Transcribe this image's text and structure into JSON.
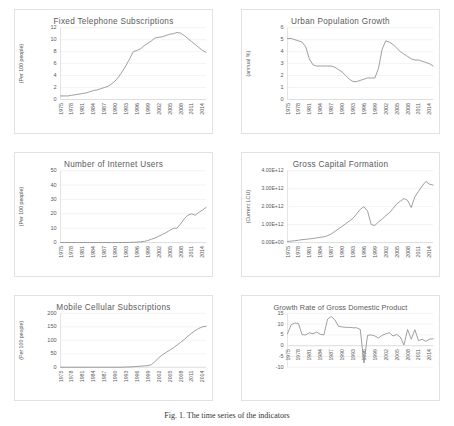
{
  "figure": {
    "caption": "Fig. 1. The time series of the indicators"
  },
  "chart_data": [
    {
      "type": "line",
      "title": "Fixed Telephone Subscriptions",
      "ylabel": "(Per 100 people)",
      "xlabel": "",
      "ylim": [
        0,
        12
      ],
      "yticks": [
        0,
        2,
        4,
        6,
        8,
        10,
        12
      ],
      "ytick_labels": [
        "0",
        "2",
        "4",
        "6",
        "8",
        "10",
        "12"
      ],
      "grid": true,
      "legend": "none",
      "xlim": [
        1975,
        2015
      ],
      "xtick_labels": [
        "1975",
        "1978",
        "1981",
        "1984",
        "1987",
        "1990",
        "1993",
        "1996",
        "1999",
        "2002",
        "2005",
        "2008",
        "2011",
        "2014"
      ],
      "x": [
        1975,
        1976,
        1977,
        1978,
        1979,
        1980,
        1981,
        1982,
        1983,
        1984,
        1985,
        1986,
        1987,
        1988,
        1989,
        1990,
        1991,
        1992,
        1993,
        1994,
        1995,
        1996,
        1997,
        1998,
        1999,
        2000,
        2001,
        2002,
        2003,
        2004,
        2005,
        2006,
        2007,
        2008,
        2009,
        2010,
        2011,
        2012,
        2013,
        2014,
        2015
      ],
      "values": [
        0.6,
        0.6,
        0.6,
        0.7,
        0.8,
        0.9,
        1.0,
        1.1,
        1.3,
        1.5,
        1.6,
        1.8,
        2.0,
        2.2,
        2.6,
        3.1,
        3.8,
        4.7,
        5.7,
        6.8,
        8.0,
        8.2,
        8.5,
        9.0,
        9.4,
        9.8,
        10.3,
        10.4,
        10.5,
        10.7,
        10.9,
        11.0,
        11.2,
        11.1,
        10.7,
        10.2,
        9.7,
        9.2,
        8.7,
        8.2,
        7.9
      ]
    },
    {
      "type": "line",
      "title": "Urban Population Growth",
      "ylabel": "(annual %)",
      "xlabel": "",
      "ylim": [
        0,
        6
      ],
      "yticks": [
        0,
        1,
        2,
        3,
        4,
        5,
        6
      ],
      "ytick_labels": [
        "0",
        "1",
        "2",
        "3",
        "4",
        "5",
        "6"
      ],
      "grid": true,
      "legend": "none",
      "xlim": [
        1975,
        2015
      ],
      "xtick_labels": [
        "1975",
        "1978",
        "1981",
        "1984",
        "1987",
        "1990",
        "1993",
        "1996",
        "1999",
        "2002",
        "2005",
        "2008",
        "2011",
        "2014"
      ],
      "x": [
        1975,
        1976,
        1977,
        1978,
        1979,
        1980,
        1981,
        1982,
        1983,
        1984,
        1985,
        1986,
        1987,
        1988,
        1989,
        1990,
        1991,
        1992,
        1993,
        1994,
        1995,
        1996,
        1997,
        1998,
        1999,
        2000,
        2001,
        2002,
        2003,
        2004,
        2005,
        2006,
        2007,
        2008,
        2009,
        2010,
        2011,
        2012,
        2013,
        2014,
        2015
      ],
      "values": [
        5.1,
        5.1,
        5.0,
        4.9,
        4.8,
        4.4,
        3.4,
        2.9,
        2.8,
        2.8,
        2.8,
        2.8,
        2.8,
        2.7,
        2.5,
        2.3,
        2.0,
        1.7,
        1.5,
        1.5,
        1.6,
        1.7,
        1.8,
        1.8,
        1.8,
        2.6,
        4.2,
        4.9,
        4.8,
        4.6,
        4.3,
        4.0,
        3.8,
        3.6,
        3.4,
        3.3,
        3.3,
        3.2,
        3.1,
        3.0,
        2.8
      ]
    },
    {
      "type": "line",
      "title": "Number of Internet Users",
      "ylabel": "(Per 100 people)",
      "xlabel": "",
      "ylim": [
        0,
        50
      ],
      "yticks": [
        0,
        10,
        20,
        30,
        40,
        50
      ],
      "ytick_labels": [
        "0",
        "10",
        "20",
        "30",
        "40",
        "50"
      ],
      "grid": true,
      "legend": "none",
      "xlim": [
        1975,
        2015
      ],
      "xtick_labels": [
        "1975",
        "1978",
        "1981",
        "1984",
        "1987",
        "1990",
        "1993",
        "1996",
        "1999",
        "2002",
        "2005",
        "2008",
        "2011",
        "2014"
      ],
      "x": [
        1975,
        1976,
        1977,
        1978,
        1979,
        1980,
        1981,
        1982,
        1983,
        1984,
        1985,
        1986,
        1987,
        1988,
        1989,
        1990,
        1991,
        1992,
        1993,
        1994,
        1995,
        1996,
        1997,
        1998,
        1999,
        2000,
        2001,
        2002,
        2003,
        2004,
        2005,
        2006,
        2007,
        2008,
        2009,
        2010,
        2011,
        2012,
        2013,
        2014,
        2015
      ],
      "values": [
        0,
        0,
        0,
        0,
        0,
        0,
        0,
        0,
        0,
        0,
        0,
        0,
        0,
        0,
        0,
        0,
        0,
        0,
        0.1,
        0.1,
        0.2,
        0.3,
        0.5,
        0.8,
        1.4,
        2.3,
        3.2,
        4.4,
        5.6,
        6.9,
        8.5,
        9.9,
        10.0,
        13.0,
        16.5,
        19.0,
        20.0,
        19.0,
        21.0,
        22.5,
        24.5,
        27.0,
        31.0,
        34.0,
        36.5,
        40.0
      ]
    },
    {
      "type": "line",
      "title": "Gross Capital Formation",
      "ylabel": "(Current LCU)",
      "xlabel": "",
      "ylim": [
        0,
        4000000000000
      ],
      "yticks": [
        0,
        1000000000000,
        2000000000000,
        3000000000000,
        4000000000000
      ],
      "ytick_labels": [
        "0.00E+00",
        "1.00E+12",
        "2.00E+12",
        "3.00E+12",
        "4.00E+12"
      ],
      "grid": true,
      "legend": "none",
      "xlim": [
        1975,
        2015
      ],
      "xtick_labels": [
        "1975",
        "1978",
        "1981",
        "1984",
        "1987",
        "1990",
        "1993",
        "1996",
        "1999",
        "2002",
        "2005",
        "2008",
        "2011",
        "2014"
      ],
      "x": [
        1975,
        1976,
        1977,
        1978,
        1979,
        1980,
        1981,
        1982,
        1983,
        1984,
        1985,
        1986,
        1987,
        1988,
        1989,
        1990,
        1991,
        1992,
        1993,
        1994,
        1995,
        1996,
        1997,
        1998,
        1999,
        2000,
        2001,
        2002,
        2003,
        2004,
        2005,
        2006,
        2007,
        2008,
        2009,
        2010,
        2011,
        2012,
        2013,
        2014,
        2015
      ],
      "values": [
        60000000000,
        80000000000,
        100000000000,
        130000000000,
        160000000000,
        180000000000,
        200000000000,
        230000000000,
        260000000000,
        290000000000,
        320000000000,
        380000000000,
        480000000000,
        620000000000,
        760000000000,
        900000000000,
        1050000000000,
        1200000000000,
        1350000000000,
        1600000000000,
        1850000000000,
        2000000000000,
        1750000000000,
        1000000000000,
        950000000000,
        1150000000000,
        1300000000000,
        1500000000000,
        1650000000000,
        1900000000000,
        2150000000000,
        2300000000000,
        2450000000000,
        2350000000000,
        1950000000000,
        2550000000000,
        2850000000000,
        3150000000000,
        3400000000000,
        3250000000000,
        3200000000000
      ]
    },
    {
      "type": "line",
      "title": "Mobile Cellular Subscriptions",
      "ylabel": "(Per 100 people)",
      "xlabel": "",
      "ylim": [
        0,
        200
      ],
      "yticks": [
        0,
        50,
        100,
        150,
        200
      ],
      "ytick_labels": [
        "0",
        "50",
        "100",
        "150",
        "200"
      ],
      "grid": true,
      "legend": "none",
      "xlim": [
        1975,
        2015
      ],
      "xtick_labels": [
        "1975",
        "1978",
        "1981",
        "1984",
        "1987",
        "1990",
        "1993",
        "1996",
        "1999",
        "2002",
        "2005",
        "2008",
        "2011",
        "2014"
      ],
      "x": [
        1975,
        1976,
        1977,
        1978,
        1979,
        1980,
        1981,
        1982,
        1983,
        1984,
        1985,
        1986,
        1987,
        1988,
        1989,
        1990,
        1991,
        1992,
        1993,
        1994,
        1995,
        1996,
        1997,
        1998,
        1999,
        2000,
        2001,
        2002,
        2003,
        2004,
        2005,
        2006,
        2007,
        2008,
        2009,
        2010,
        2011,
        2012,
        2013,
        2014,
        2015
      ],
      "values": [
        0,
        0,
        0,
        0,
        0,
        0,
        0,
        0,
        0,
        0,
        0,
        0,
        0,
        0,
        0,
        0,
        0,
        0,
        1,
        1,
        2,
        3,
        4,
        5,
        6,
        10,
        22,
        35,
        46,
        55,
        63,
        72,
        82,
        92,
        103,
        115,
        126,
        136,
        144,
        150,
        152
      ]
    },
    {
      "type": "line",
      "title": "Growth Rate of Gross Domestic Product",
      "ylabel": "",
      "xlabel": "",
      "ylim": [
        -10,
        15
      ],
      "yticks": [
        -10,
        -5,
        0,
        5,
        10,
        15
      ],
      "ytick_labels": [
        "-10",
        "-5",
        "0",
        "5",
        "10",
        "15"
      ],
      "grid": true,
      "legend": "none",
      "xlim": [
        1975,
        2015
      ],
      "xtick_labels": [
        "1975",
        "1978",
        "1981",
        "1984",
        "1987",
        "1990",
        "1993",
        "1996",
        "1999",
        "2002",
        "2005",
        "2008",
        "2011",
        "2014"
      ],
      "x": [
        1975,
        1976,
        1977,
        1978,
        1979,
        1980,
        1981,
        1982,
        1983,
        1984,
        1985,
        1986,
        1987,
        1988,
        1989,
        1990,
        1991,
        1992,
        1993,
        1994,
        1995,
        1996,
        1997,
        1998,
        1999,
        2000,
        2001,
        2002,
        2003,
        2004,
        2005,
        2006,
        2007,
        2008,
        2009,
        2010,
        2011,
        2012,
        2013,
        2014,
        2015
      ],
      "values": [
        5.6,
        9.7,
        10.5,
        10.3,
        5.1,
        5.0,
        6.0,
        5.5,
        6.3,
        5.3,
        5.0,
        12.3,
        13.5,
        12.0,
        9.0,
        8.7,
        8.5,
        8.5,
        8.3,
        8.3,
        7.5,
        -8.0,
        4.8,
        5.0,
        4.5,
        3.6,
        4.8,
        5.5,
        6.0,
        4.5,
        5.2,
        4.0,
        0.3,
        7.5,
        3.0,
        7.4,
        2.3,
        3.0,
        2.0,
        3.0,
        3.2
      ]
    }
  ]
}
